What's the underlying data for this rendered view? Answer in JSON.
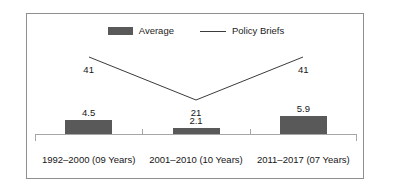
{
  "chart_data": {
    "type": "bar",
    "title": "",
    "subtitle": "",
    "xlabel": "",
    "ylabel": "",
    "grid": false,
    "legend_position": "top-center",
    "categories": [
      "1992–2000 (09 Years)",
      "2001–2010 (10 Years)",
      "2011–2017 (07 Years)"
    ],
    "series": [
      {
        "name": "Average",
        "type": "bar",
        "color": "#595959",
        "values": [
          4.5,
          2.1,
          5.9
        ],
        "value_labels": [
          "4.5",
          "2.1",
          "5.9"
        ]
      },
      {
        "name": "Policy Briefs",
        "type": "line",
        "color": "#3b3b3b",
        "values": [
          41,
          21,
          41
        ],
        "value_labels": [
          "41",
          "21",
          "41"
        ]
      }
    ],
    "bar_axis_range": [
      0,
      6.6
    ],
    "line_axis_range": [
      0,
      48
    ],
    "annotations": []
  },
  "legend": {
    "items": [
      {
        "label": "Average",
        "swatch": "bar-swatch",
        "color": "#595959"
      },
      {
        "label": "Policy Briefs",
        "swatch": "line-swatch",
        "color": "#3b3b3b"
      }
    ]
  },
  "axis": {
    "line_color": "#a6a6a6",
    "frame_color": "#8f8f8f"
  }
}
